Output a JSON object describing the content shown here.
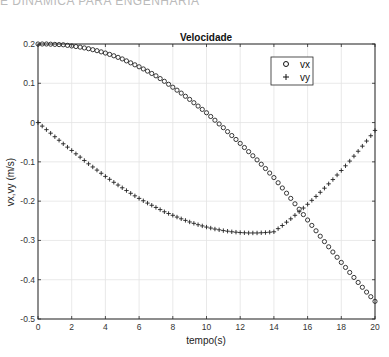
{
  "header": {
    "cut_text": "E DINÂMICA PARA ENGENHARIA"
  },
  "chart_data": {
    "type": "scatter",
    "title": "Velocidade",
    "xlabel": "tempo(s)",
    "ylabel": "vx,vy (m/s)",
    "xlim": [
      0,
      20
    ],
    "ylim": [
      -0.5,
      0.2
    ],
    "xticks": [
      0,
      2,
      4,
      6,
      8,
      10,
      12,
      14,
      16,
      18,
      20
    ],
    "yticks": [
      0.2,
      0.1,
      0,
      -0.1,
      -0.2,
      -0.3,
      -0.4,
      -0.5
    ],
    "ytick_labels": [
      "0.2",
      "0.1",
      "0",
      "-0.1",
      "-0.2",
      "-0.3",
      "-0.4",
      "-0.5"
    ],
    "grid": true,
    "legend_position": "upper right",
    "x": [
      0,
      0.5,
      1,
      1.5,
      2,
      2.5,
      3,
      3.5,
      4,
      4.5,
      5,
      5.5,
      6,
      6.5,
      7,
      7.5,
      8,
      8.5,
      9,
      9.5,
      10,
      10.5,
      11,
      11.5,
      12,
      12.5,
      13,
      13.5,
      14,
      14.5,
      15,
      15.5,
      16,
      16.5,
      17,
      17.5,
      18,
      18.5,
      19,
      19.5,
      20
    ],
    "series": [
      {
        "name": "vx",
        "marker": "o",
        "values": [
          0.2,
          0.2,
          0.199,
          0.198,
          0.195,
          0.192,
          0.188,
          0.183,
          0.177,
          0.17,
          0.162,
          0.152,
          0.142,
          0.131,
          0.119,
          0.105,
          0.09,
          0.075,
          0.059,
          0.042,
          0.025,
          0.006,
          -0.013,
          -0.033,
          -0.053,
          -0.074,
          -0.095,
          -0.117,
          -0.14,
          -0.163,
          -0.186,
          -0.21,
          -0.234,
          -0.258,
          -0.282,
          -0.305,
          -0.328,
          -0.35,
          -0.372,
          -0.393,
          -0.413
        ]
      },
      {
        "name": "vy",
        "marker": "+",
        "values": [
          0.0,
          -0.018,
          -0.036,
          -0.054,
          -0.071,
          -0.088,
          -0.105,
          -0.121,
          -0.137,
          -0.152,
          -0.166,
          -0.18,
          -0.193,
          -0.205,
          -0.216,
          -0.227,
          -0.236,
          -0.245,
          -0.253,
          -0.26,
          -0.266,
          -0.271,
          -0.275,
          -0.278,
          -0.28,
          -0.281,
          -0.281,
          -0.28,
          -0.278,
          -0.275,
          -0.271,
          -0.266,
          -0.26,
          -0.253,
          -0.245,
          -0.236,
          -0.226,
          -0.215,
          -0.203,
          -0.19,
          -0.176
        ]
      }
    ]
  }
}
